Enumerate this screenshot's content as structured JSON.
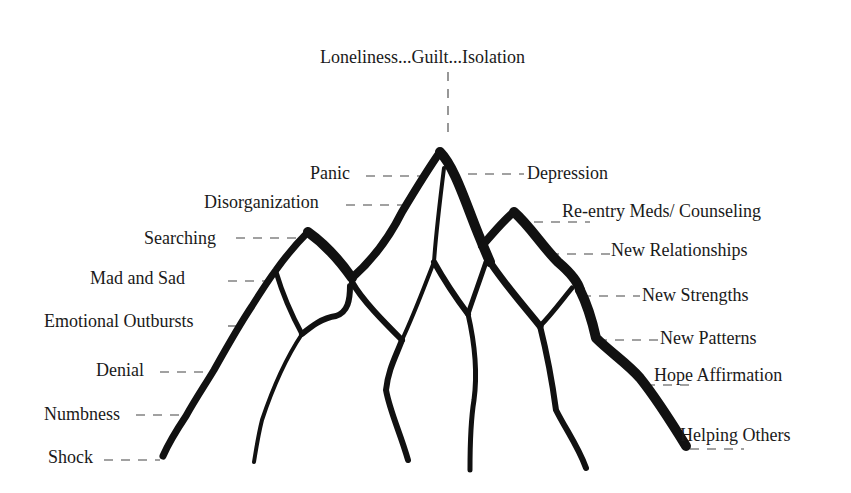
{
  "diagram": {
    "type": "mountain-grief-stages",
    "summit_label": "Loneliness...Guilt...Isolation",
    "left_labels": [
      {
        "id": "panic",
        "text": "Panic"
      },
      {
        "id": "disorganization",
        "text": "Disorganization"
      },
      {
        "id": "searching",
        "text": "Searching"
      },
      {
        "id": "mad-and-sad",
        "text": "Mad and Sad"
      },
      {
        "id": "emotional-outbursts",
        "text": "Emotional Outbursts"
      },
      {
        "id": "denial",
        "text": "Denial"
      },
      {
        "id": "numbness",
        "text": "Numbness"
      },
      {
        "id": "shock",
        "text": "Shock"
      }
    ],
    "right_labels": [
      {
        "id": "depression",
        "text": "Depression"
      },
      {
        "id": "re-entry",
        "text": "Re-entry Meds/ Counseling"
      },
      {
        "id": "new-relationships",
        "text": "New Relationships"
      },
      {
        "id": "new-strengths",
        "text": "New Strengths"
      },
      {
        "id": "new-patterns",
        "text": "New Patterns"
      },
      {
        "id": "hope-affirmation",
        "text": "Hope Affirmation"
      },
      {
        "id": "helping-others",
        "text": "Helping Others"
      }
    ],
    "colors": {
      "ink": "#111111",
      "background": "#ffffff"
    }
  }
}
